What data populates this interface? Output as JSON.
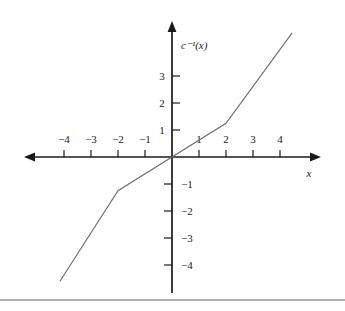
{
  "figure": {
    "y_axis_label": "c⁻¹(x)",
    "x_axis_label": "x",
    "x_tick_labels": [
      "−4",
      "−3",
      "−2",
      "−1",
      "1",
      "2",
      "3",
      "4"
    ],
    "y_tick_labels_positive": [
      "3",
      "2",
      "1"
    ],
    "y_tick_labels_negative": [
      "−1",
      "−2",
      "−3",
      "−4"
    ],
    "curve_color": "#6e6e72",
    "axis_color": "#1a1a1a"
  },
  "chart_data": {
    "type": "line",
    "title": "",
    "subtitle": "",
    "xlabel": "x",
    "ylabel": "c⁻¹(x)",
    "xlim": [
      -5.4,
      5.5
    ],
    "ylim": [
      -5.0,
      5.0
    ],
    "grid": false,
    "legend": null,
    "xticks": [
      -4,
      -3,
      -2,
      -1,
      1,
      2,
      3,
      4
    ],
    "xticklabels": [
      "−4",
      "−3",
      "−2",
      "−1",
      "1",
      "2",
      "3",
      "4"
    ],
    "yticks": [
      3,
      2,
      1,
      -1,
      -2,
      -3,
      -4
    ],
    "yticklabels": [
      "3",
      "2",
      "1",
      "−1",
      "−2",
      "−3",
      "−4"
    ],
    "series": [
      {
        "name": "c⁻¹(x)",
        "piecewise_linear": true,
        "x": [
          -4.15,
          -2.0,
          2.0,
          4.45
        ],
        "y": [
          -4.6,
          -1.25,
          1.25,
          4.6
        ],
        "segments": [
          {
            "from": [
              -4.15,
              -4.6
            ],
            "to": [
              -2.0,
              -1.25
            ],
            "slope": 1.56
          },
          {
            "from": [
              -2.0,
              -1.25
            ],
            "to": [
              2.0,
              1.25
            ],
            "slope": 0.625
          },
          {
            "from": [
              2.0,
              1.25
            ],
            "to": [
              4.45,
              4.6
            ],
            "slope": 1.37
          }
        ],
        "breakpoints": [
          [
            -2.0,
            -1.25
          ],
          [
            2.0,
            1.25
          ]
        ],
        "passes_through_origin": true
      }
    ]
  }
}
